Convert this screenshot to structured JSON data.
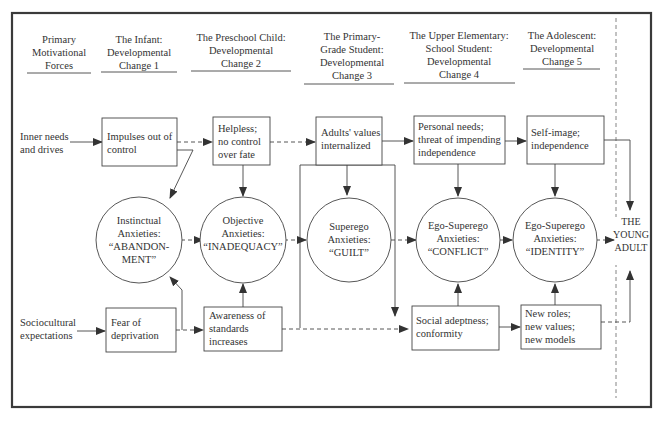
{
  "headers": [
    {
      "id": "forces",
      "lines": [
        "Primary",
        "Motivational",
        "Forces"
      ]
    },
    {
      "id": "stage1",
      "lines": [
        "The Infant:",
        "Developmental",
        "Change 1"
      ]
    },
    {
      "id": "stage2",
      "lines": [
        "The Preschool Child:",
        "Developmental",
        "Change 2"
      ]
    },
    {
      "id": "stage3",
      "lines": [
        "The Primary-",
        "Grade Student:",
        "Developmental",
        "Change 3"
      ]
    },
    {
      "id": "stage4",
      "lines": [
        "The Upper Elementary:",
        "School Student:",
        "Developmental",
        "Change 4"
      ]
    },
    {
      "id": "stage5",
      "lines": [
        "The Adolescent:",
        "Developmental",
        "Change 5"
      ]
    }
  ],
  "forces": {
    "inner": [
      "Inner needs",
      "and drives"
    ],
    "socio": [
      "Sociocultural",
      "expectations"
    ]
  },
  "top_boxes": [
    {
      "id": "impulses",
      "lines": [
        "Impulses out of",
        "control"
      ]
    },
    {
      "id": "helpless",
      "lines": [
        "Helpless;",
        "no control",
        "over fate"
      ]
    },
    {
      "id": "adults-values",
      "lines": [
        "Adults' values",
        "internalized"
      ]
    },
    {
      "id": "personal-needs",
      "lines": [
        "Personal needs;",
        "threat of impending",
        "independence"
      ]
    },
    {
      "id": "self-image",
      "lines": [
        "Self-image;",
        "independence"
      ]
    }
  ],
  "circles": [
    {
      "id": "instinctual",
      "lines": [
        "Instinctual",
        "Anxieties:",
        "“ABANDON-",
        "MENT”"
      ]
    },
    {
      "id": "objective",
      "lines": [
        "Objective",
        "Anxieties:",
        "“INADEQUACY”"
      ]
    },
    {
      "id": "superego",
      "lines": [
        "Superego",
        "Anxieties:",
        "“GUILT”"
      ]
    },
    {
      "id": "ego-superego-conflict",
      "lines": [
        "Ego-Superego",
        "Anxieties:",
        "“CONFLICT”"
      ]
    },
    {
      "id": "ego-superego-identity",
      "lines": [
        "Ego-Superego",
        "Anxieties:",
        "“IDENTITY”"
      ]
    }
  ],
  "bottom_boxes": [
    {
      "id": "fear",
      "lines": [
        "Fear of",
        "deprivation"
      ]
    },
    {
      "id": "awareness",
      "lines": [
        "Awareness of",
        "standards",
        "increases"
      ]
    },
    {
      "id": "social",
      "lines": [
        "Social adeptness;",
        "conformity"
      ]
    },
    {
      "id": "new-roles",
      "lines": [
        "New roles;",
        "new values;",
        "new models"
      ]
    }
  ],
  "outcome": {
    "lines": [
      "THE",
      "YOUNG",
      "ADULT"
    ]
  }
}
